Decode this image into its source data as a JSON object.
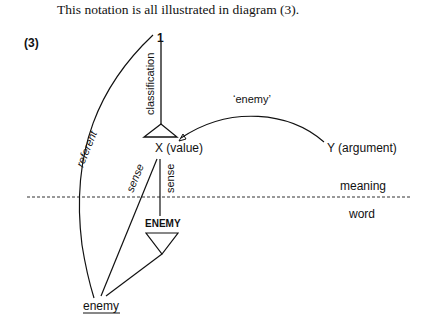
{
  "caption": "This notation is all illustrated in diagram (3).",
  "example_number": "(3)",
  "diagram": {
    "nodes": {
      "top": "1",
      "value": "X (value)",
      "argument": "Y (argument)",
      "lexeme": "ENEMY",
      "word_form": "enemy"
    },
    "edge_labels": {
      "classification": "classification",
      "referent": "referent",
      "sense_diagonal": "sense",
      "sense_vertical": "sense",
      "argument_relation": "‘enemy’"
    },
    "levels": {
      "upper": "meaning",
      "lower": "word"
    }
  }
}
